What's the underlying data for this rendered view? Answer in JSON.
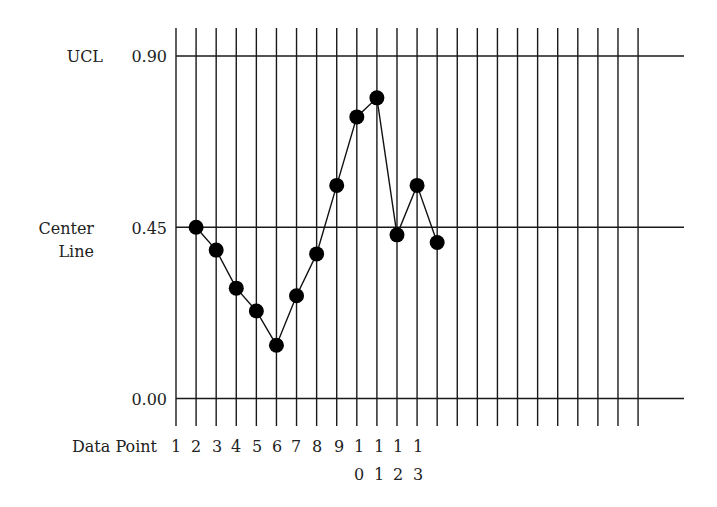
{
  "chart_data": {
    "type": "line",
    "title": "",
    "subtype": "control-chart",
    "xlabel": "Data Point",
    "ylabel": "",
    "x_tick_labels": [
      "1",
      "2",
      "3",
      "4",
      "5",
      "6",
      "7",
      "8",
      "9",
      "10",
      "11",
      "12",
      "13"
    ],
    "x": [
      1,
      2,
      3,
      4,
      5,
      6,
      7,
      8,
      9,
      10,
      11,
      12,
      13
    ],
    "values": [
      0.45,
      0.39,
      0.29,
      0.23,
      0.14,
      0.27,
      0.38,
      0.56,
      0.74,
      0.79,
      0.43,
      0.56,
      0.41
    ],
    "series": [
      {
        "name": "Data Point",
        "values": [
          0.45,
          0.39,
          0.29,
          0.23,
          0.14,
          0.27,
          0.38,
          0.56,
          0.74,
          0.79,
          0.43,
          0.56,
          0.41
        ]
      }
    ],
    "reference_lines": [
      {
        "label": "UCL",
        "value": 0.9,
        "value_label": "0.90"
      },
      {
        "label": "Center Line",
        "value": 0.45,
        "value_label": "0.45"
      },
      {
        "label": "",
        "value": 0.0,
        "value_label": "0.00"
      }
    ],
    "y_ticks": [
      "0.00",
      "0.45",
      "0.90"
    ],
    "ylim": [
      0.0,
      0.9
    ],
    "grid": {
      "vertical_lines": 24,
      "horizontal_lines": 3
    },
    "legend": null
  },
  "labels": {
    "ucl": "UCL",
    "center_line_1": "Center",
    "center_line_2": "Line",
    "y_090": "0.90",
    "y_045": "0.45",
    "y_000": "0.00",
    "x_axis": "Data Point"
  },
  "style": {
    "line_color": "#111111",
    "dot_color": "#000000",
    "grid_color": "#1a1a1a",
    "background": "#ffffff"
  }
}
